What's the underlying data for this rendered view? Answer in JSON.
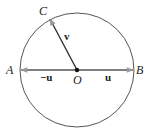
{
  "diagram": {
    "points": {
      "A": "A",
      "B": "B",
      "C": "C",
      "O": "O"
    },
    "vectors": {
      "u": "u",
      "neg_u": "−u",
      "v": "v"
    },
    "colors": {
      "circle": "#555555",
      "vector_line": "#333333",
      "arrowhead": "#9a9a9a",
      "center_dot": "#111111"
    }
  }
}
